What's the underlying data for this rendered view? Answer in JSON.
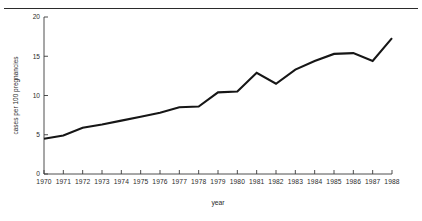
{
  "chart_data": {
    "type": "line",
    "title": "",
    "subtitle": "",
    "xlabel": "year",
    "ylabel": "cases per 100 pregnancies",
    "xlim": [
      1970,
      1988
    ],
    "ylim": [
      0,
      20
    ],
    "grid": false,
    "legend": null,
    "legend_position": "none",
    "ytick_labels": [
      "0",
      "5",
      "10",
      "15",
      "20"
    ],
    "ytick_values": [
      0,
      5,
      10,
      15,
      20
    ],
    "xtick_labels": [
      "1970",
      "1971",
      "1972",
      "1973",
      "1974",
      "1975",
      "1976",
      "1977",
      "1978",
      "1979",
      "1980",
      "1981",
      "1982",
      "1983",
      "1984",
      "1985",
      "1986",
      "1987",
      "1988"
    ],
    "x": [
      1970,
      1971,
      1972,
      1973,
      1974,
      1975,
      1976,
      1977,
      1978,
      1979,
      1980,
      1981,
      1982,
      1983,
      1984,
      1985,
      1986,
      1987,
      1988
    ],
    "values": [
      4.5,
      4.9,
      5.9,
      6.3,
      6.8,
      7.3,
      7.8,
      8.5,
      8.6,
      10.4,
      10.5,
      12.9,
      11.5,
      13.3,
      14.4,
      15.3,
      15.4,
      14.4,
      17.3
    ],
    "series": [
      {
        "name": "cases per 100 pregnancies",
        "color": "#161616",
        "values": [
          4.5,
          4.9,
          5.9,
          6.3,
          6.8,
          7.3,
          7.8,
          8.5,
          8.6,
          10.4,
          10.5,
          12.9,
          11.5,
          13.3,
          14.4,
          15.3,
          15.4,
          14.4,
          17.3
        ]
      }
    ],
    "annotations": []
  },
  "colors": {
    "line": "#161616",
    "axis": "#3a3a3a",
    "text": "#2b2b2b",
    "background": "#ffffff",
    "rule": "#2b2b2b"
  }
}
